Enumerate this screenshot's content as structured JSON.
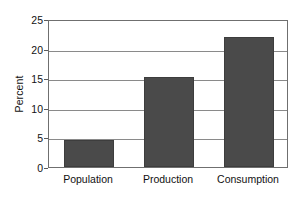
{
  "chart_data": {
    "type": "bar",
    "title": "",
    "subtitle": "",
    "xlabel": "",
    "ylabel": "Percent",
    "categories": [
      "Population",
      "Production",
      "Consumption"
    ],
    "values": [
      4.6,
      15.2,
      21.9
    ],
    "ylim": [
      0,
      25
    ],
    "yticks": [
      0,
      5,
      10,
      15,
      20,
      25
    ],
    "ytick_labels": [
      "0",
      "5",
      "10",
      "15",
      "20",
      "25"
    ],
    "grid": true,
    "grid_axis": "y",
    "legend": false,
    "legend_position": "none",
    "bar_color": "#4a4a4a",
    "frame_color": "#6f6f6f",
    "grid_color": "#8a8a8a",
    "background": "#ffffff",
    "series": [
      {
        "name": "Percent",
        "values": [
          4.6,
          15.2,
          21.9
        ]
      }
    ]
  }
}
